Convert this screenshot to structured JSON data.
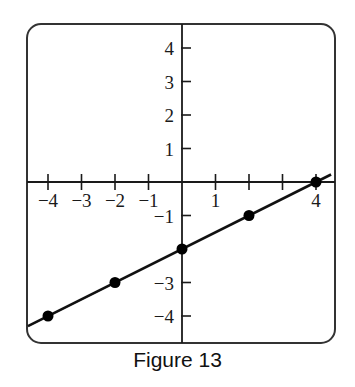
{
  "caption": "Figure 13",
  "colors": {
    "line": "#111111",
    "axes": "#1a1a1a",
    "frame": "#333333",
    "points": "#000000"
  },
  "chart_data": {
    "type": "scatter",
    "title": "Figure 13",
    "xlabel": "",
    "ylabel": "",
    "xlim": [
      -4.5,
      4.5
    ],
    "ylim": [
      -4.5,
      4.5
    ],
    "grid": false,
    "x_ticks": [
      -4,
      -3,
      -2,
      -1,
      1,
      4
    ],
    "x_tick_marks": [
      -4,
      -3,
      -2,
      -1,
      0,
      1,
      2,
      3,
      4
    ],
    "y_ticks": [
      4,
      3,
      2,
      1,
      -1,
      -3,
      -4
    ],
    "y_tick_marks": [
      4,
      3,
      2,
      1,
      -1,
      -3,
      -4
    ],
    "series": [
      {
        "name": "points",
        "x": [
          -4,
          -2,
          0,
          2,
          4
        ],
        "y": [
          -4,
          -3,
          -2,
          -1,
          0
        ]
      }
    ],
    "line": {
      "equation": "y = 0.5x - 2",
      "slope": 0.5,
      "intercept": -2,
      "x_range": [
        -4.5,
        4.5
      ]
    }
  }
}
